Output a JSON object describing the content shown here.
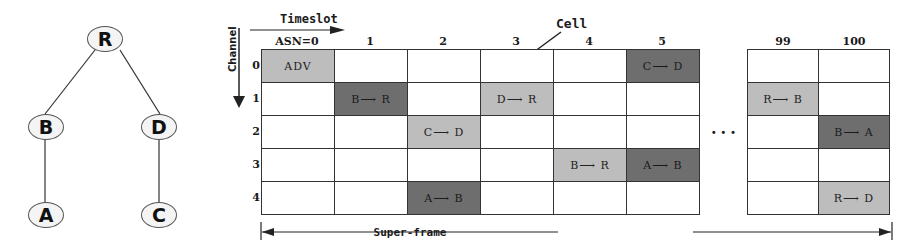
{
  "tree": {
    "nodes": [
      {
        "id": "R",
        "label": "R",
        "x": 105,
        "y": 39
      },
      {
        "id": "B",
        "label": "B",
        "x": 46,
        "y": 127
      },
      {
        "id": "D",
        "label": "D",
        "x": 159,
        "y": 127
      },
      {
        "id": "A",
        "label": "A",
        "x": 46,
        "y": 215
      },
      {
        "id": "C",
        "label": "C",
        "x": 159,
        "y": 215
      }
    ],
    "edges": [
      [
        "R",
        "B"
      ],
      [
        "R",
        "D"
      ],
      [
        "B",
        "A"
      ],
      [
        "D",
        "C"
      ]
    ]
  },
  "axes": {
    "timeslot_label": "Timeslot",
    "channel_label": "Channel",
    "superframe_label": "Super-frame",
    "cell_callout": "Cell",
    "ellipsis": "..."
  },
  "columns": [
    "ASN=0",
    "1",
    "2",
    "3",
    "4",
    "5"
  ],
  "right_columns": [
    "99",
    "100"
  ],
  "rows": [
    "0",
    "1",
    "2",
    "3",
    "4"
  ],
  "cells": [
    {
      "col": 0,
      "row": 0,
      "text": "ADV",
      "shade": "light"
    },
    {
      "col": 1,
      "row": 1,
      "text": "B⟶ R",
      "shade": "dark"
    },
    {
      "col": 2,
      "row": 2,
      "text": "C⟶ D",
      "shade": "light"
    },
    {
      "col": 2,
      "row": 4,
      "text": "A⟶ B",
      "shade": "dark"
    },
    {
      "col": 3,
      "row": 1,
      "text": "D⟶ R",
      "shade": "light"
    },
    {
      "col": 4,
      "row": 3,
      "text": "B⟶ R",
      "shade": "light"
    },
    {
      "col": 5,
      "row": 0,
      "text": "C⟶ D",
      "shade": "dark"
    },
    {
      "col": 5,
      "row": 3,
      "text": "A⟶ B",
      "shade": "dark"
    }
  ],
  "right_cells": [
    {
      "col": 0,
      "row": 1,
      "text": "R⟶ B",
      "shade": "light"
    },
    {
      "col": 1,
      "row": 2,
      "text": "B⟶ A",
      "shade": "dark"
    },
    {
      "col": 1,
      "row": 4,
      "text": "R⟶ D",
      "shade": "light"
    }
  ],
  "colors": {
    "light": "#bdbdbd",
    "dark": "#6e6e6e",
    "line": "#333333"
  }
}
